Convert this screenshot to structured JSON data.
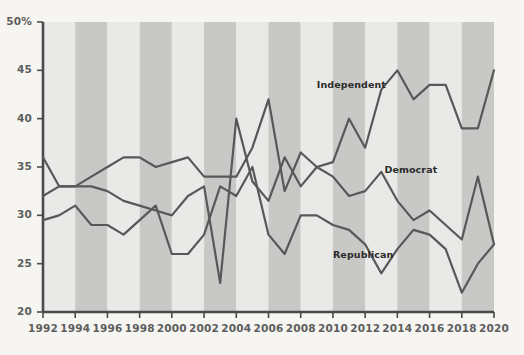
{
  "chart_data": {
    "type": "line",
    "title": "",
    "subtitle": "",
    "xlabel": "",
    "ylabel": "",
    "xlim": [
      1992,
      2020
    ],
    "ylim": [
      20,
      50
    ],
    "yticks": [
      20,
      25,
      30,
      35,
      40,
      45,
      50
    ],
    "ytick_labels": [
      "20",
      "25",
      "30",
      "35",
      "40",
      "45",
      "50%"
    ],
    "xticks": [
      1992,
      1994,
      1996,
      1998,
      2000,
      2002,
      2004,
      2006,
      2008,
      2010,
      2012,
      2014,
      2016,
      2018,
      2020
    ],
    "xtick_labels": [
      "1992",
      "1994",
      "1996",
      "1998",
      "2000",
      "2002",
      "2004",
      "2006",
      "2008",
      "2010",
      "2012",
      "2014",
      "2016",
      "2018",
      "2020"
    ],
    "grid": false,
    "legend_position": "inline-annotations",
    "background_stripes": true,
    "stripe_span_years": 2,
    "x": [
      1992,
      1993,
      1994,
      1995,
      1996,
      1997,
      1998,
      1999,
      2000,
      2001,
      2002,
      2003,
      2004,
      2005,
      2006,
      2007,
      2008,
      2009,
      2010,
      2011,
      2012,
      2013,
      2014,
      2015,
      2016,
      2017,
      2018,
      2019,
      2020
    ],
    "series": [
      {
        "name": "Independent",
        "label_x": 2009.0,
        "label_y": 43.2,
        "color": "#585858",
        "values": [
          36.0,
          33.0,
          33.0,
          33.0,
          32.5,
          31.5,
          31.0,
          30.5,
          30.0,
          32.0,
          33.0,
          23.0,
          40.0,
          33.5,
          31.5,
          36.0,
          33.0,
          35.0,
          35.5,
          40.0,
          37.0,
          43.0,
          45.0,
          42.0,
          43.5,
          43.5,
          39.0,
          39.0,
          45.0
        ]
      },
      {
        "name": "Democrat",
        "label_x": 2013.2,
        "label_y": 34.4,
        "color": "#585858",
        "values": [
          32.0,
          33.0,
          33.0,
          34.0,
          35.0,
          36.0,
          36.0,
          35.0,
          35.5,
          36.0,
          34.0,
          34.0,
          34.0,
          37.0,
          42.0,
          32.5,
          36.5,
          35.0,
          34.0,
          32.0,
          32.5,
          34.5,
          31.5,
          29.5,
          30.5,
          29.0,
          27.5,
          34.0,
          27.0
        ]
      },
      {
        "name": "Republican",
        "label_x": 2010.0,
        "label_y": 25.6,
        "color": "#585858",
        "values": [
          29.5,
          30.0,
          31.0,
          29.0,
          29.0,
          28.0,
          29.5,
          31.0,
          26.0,
          26.0,
          28.0,
          33.0,
          32.0,
          35.0,
          28.0,
          26.0,
          30.0,
          30.0,
          29.0,
          28.5,
          27.0,
          24.0,
          26.5,
          28.5,
          28.0,
          26.5,
          22.0,
          25.0,
          27.0
        ]
      }
    ]
  },
  "colors": {
    "background": "#f6f5f2",
    "stripe_light": "#e9e9e7",
    "stripe_dark": "#c8c8c6",
    "line": "#585858",
    "axis": "#4a4a4a",
    "tick_text": "#5d5d5d",
    "label_text": "#2b2b2b"
  }
}
